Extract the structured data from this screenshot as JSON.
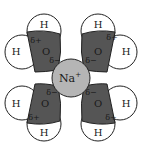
{
  "diagram": {
    "colors": {
      "background": "#ffffff",
      "oxygen_fill": "#555555",
      "hydrogen_fill": "#ffffff",
      "ion_fill": "#b5b5b5",
      "stroke": "#222222"
    },
    "ion": {
      "label": "Na",
      "charge": "+"
    },
    "molecules": [
      {
        "position": "top-left",
        "oxygen": "O",
        "h1": "H",
        "h2": "H",
        "delta_plus": "δ+",
        "delta_minus": "δ−"
      },
      {
        "position": "top-right",
        "oxygen": "O",
        "h1": "H",
        "h2": "H",
        "delta_plus": "δ+",
        "delta_minus": "δ−"
      },
      {
        "position": "bottom-left",
        "oxygen": "O",
        "h1": "H",
        "h2": "H",
        "delta_plus": "δ+",
        "delta_minus": "δ−"
      },
      {
        "position": "bottom-right",
        "oxygen": "O",
        "h1": "H",
        "h2": "H",
        "delta_plus": "δ+",
        "delta_minus": "δ−"
      }
    ]
  }
}
